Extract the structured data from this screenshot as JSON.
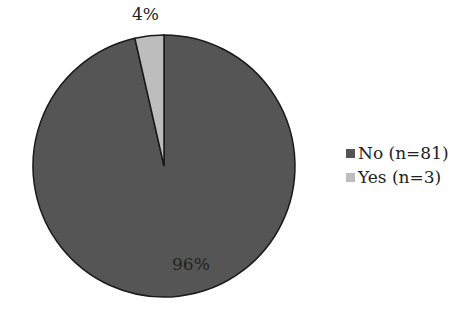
{
  "chart_data": {
    "type": "pie",
    "title": "",
    "categories": [
      "No (n=81)",
      "Yes (n=3)"
    ],
    "values": [
      96,
      4
    ],
    "counts": [
      81,
      3
    ],
    "data_labels": [
      "96%",
      "4%"
    ],
    "colors": [
      "#555555",
      "#bdbdbd"
    ],
    "legend_position": "right",
    "start_angle_deg": 0,
    "direction": "counterclockwise-from-top (Yes slice left of 12 o'clock)"
  },
  "legend": {
    "items": [
      {
        "label": "No (n=81)",
        "color": "#555555"
      },
      {
        "label": "Yes (n=3)",
        "color": "#bdbdbd"
      }
    ]
  },
  "labels": {
    "no_pct": "96%",
    "yes_pct": "4%"
  }
}
